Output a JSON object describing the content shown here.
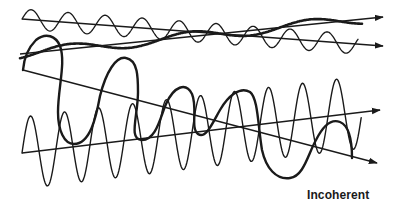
{
  "figure": {
    "caption": "Incoherent",
    "stroke_color": "#1a1a1a",
    "background": "#ffffff",
    "waves": [
      {
        "id": "top-short-wave",
        "axis_start": [
          22,
          19
        ],
        "axis_end": [
          383,
          46
        ],
        "period_px": 37,
        "amplitude_px": 10,
        "stroke_width": 1.3,
        "style": "thin sine wave"
      },
      {
        "id": "thick-low-wave",
        "axis_start": [
          20,
          54
        ],
        "axis_end": [
          383,
          17
        ],
        "period_px": 120,
        "amplitude_px": 5,
        "stroke_width": 2.6,
        "style": "thick long-wavelength wave"
      },
      {
        "id": "large-irregular-wave",
        "axis_start": [
          23,
          70
        ],
        "axis_end": [
          377,
          163
        ],
        "amplitude_px": 40,
        "stroke_width": 2.4,
        "style": "thick irregular large-amplitude wave"
      },
      {
        "id": "tall-dense-wave",
        "axis_start": [
          22,
          153
        ],
        "axis_end": [
          380,
          110
        ],
        "period_px": 34,
        "amplitude_px": 36,
        "stroke_width": 1.4,
        "style": "thin tall sine wave"
      }
    ]
  }
}
